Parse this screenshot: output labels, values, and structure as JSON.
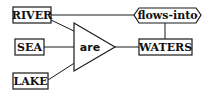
{
  "diagram": {
    "type": "semantic-network",
    "nodes": [
      {
        "id": "river",
        "label": "RIVER",
        "shape": "rectangle"
      },
      {
        "id": "sea",
        "label": "SEA",
        "shape": "rectangle"
      },
      {
        "id": "lake",
        "label": "LAKE",
        "shape": "rectangle"
      },
      {
        "id": "are",
        "label": "are",
        "shape": "triangle"
      },
      {
        "id": "waters",
        "label": "WATERS",
        "shape": "rectangle"
      },
      {
        "id": "flows_into",
        "label": "flows-into",
        "shape": "hexagon"
      }
    ],
    "edges": [
      {
        "from": "river",
        "to": "are"
      },
      {
        "from": "sea",
        "to": "are"
      },
      {
        "from": "lake",
        "to": "are"
      },
      {
        "from": "are",
        "to": "waters"
      },
      {
        "from": "river",
        "to": "flows_into"
      },
      {
        "from": "flows_into",
        "to": "waters"
      }
    ]
  },
  "labels": {
    "river": "RIVER",
    "sea": "SEA",
    "lake": "LAKE",
    "are": "are",
    "waters": "WATERS",
    "flows_into": "flows-into"
  },
  "colors": {
    "stroke": "#1a1a1a",
    "background": "#ffffff"
  }
}
